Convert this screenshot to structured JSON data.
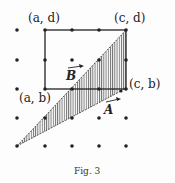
{
  "figure": {
    "caption": "Fig. 3",
    "labels": {
      "top_left": "(a, d)",
      "top_right": "(c, d)",
      "bottom_left": "(a, b)",
      "bottom_right": "(c, b)"
    },
    "vectors": {
      "A": "A",
      "B": "B"
    },
    "grid": {
      "xs": [
        17,
        45,
        72,
        99,
        126
      ],
      "ys": [
        30,
        60,
        89,
        118,
        146
      ]
    },
    "colors": {
      "ink": "#222222",
      "hatch": "#555555",
      "background": "#fdfdfd"
    }
  }
}
